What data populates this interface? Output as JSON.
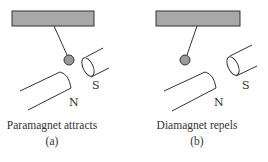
{
  "figure": {
    "panels": [
      {
        "id": "a",
        "caption": "Paramagnet attracts",
        "sublabel": "(a)",
        "pole_north": "N",
        "pole_south": "S",
        "ball_position": "attracted toward gap"
      },
      {
        "id": "b",
        "caption": "Diamagnet repels",
        "sublabel": "(b)",
        "pole_north": "N",
        "pole_south": "S",
        "ball_position": "repelled away from gap"
      }
    ],
    "colors": {
      "support_bar": "#a8a8a8",
      "ball": "#9a9a9a",
      "stroke": "#333333"
    }
  }
}
